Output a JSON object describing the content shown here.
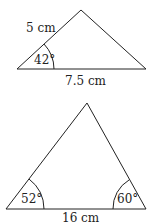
{
  "triangle1": {
    "side_label": "5 cm",
    "base_label": "7.5 cm",
    "angle_label": "42°"
  },
  "triangle2": {
    "base_label": "16 cm",
    "left_angle_label": "52°",
    "right_angle_label": "60°"
  }
}
